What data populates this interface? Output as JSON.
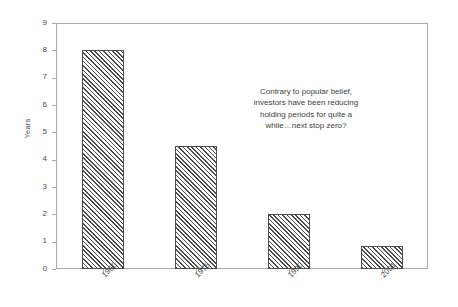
{
  "chart_data": {
    "type": "bar",
    "title": "",
    "subtitle": "",
    "xlabel": "",
    "ylabel": "Years",
    "categories": [
      "1960",
      "1975",
      "1990",
      "2001"
    ],
    "values": [
      8.0,
      4.5,
      2.0,
      0.85
    ],
    "ylim": [
      0,
      9
    ],
    "ytick_labels": [
      "0",
      "1",
      "2",
      "3",
      "4",
      "5",
      "6",
      "7",
      "8",
      "9"
    ],
    "ytick_values": [
      0,
      1,
      2,
      3,
      4,
      5,
      6,
      7,
      8,
      9
    ],
    "grid": false,
    "legend": null,
    "bar_fill": "diagonal-hatch",
    "bar_edge_color": "#4d4d4d",
    "axis_color": "#a8a8a8",
    "background_color": "#ffffff",
    "xtick_label_rotation": -45,
    "annotations": [
      {
        "lines": [
          "Contrary to popular belief,",
          "investors have been reducing",
          "holding periods for quite a",
          "while…next stop zero?"
        ],
        "align": "center"
      }
    ]
  }
}
